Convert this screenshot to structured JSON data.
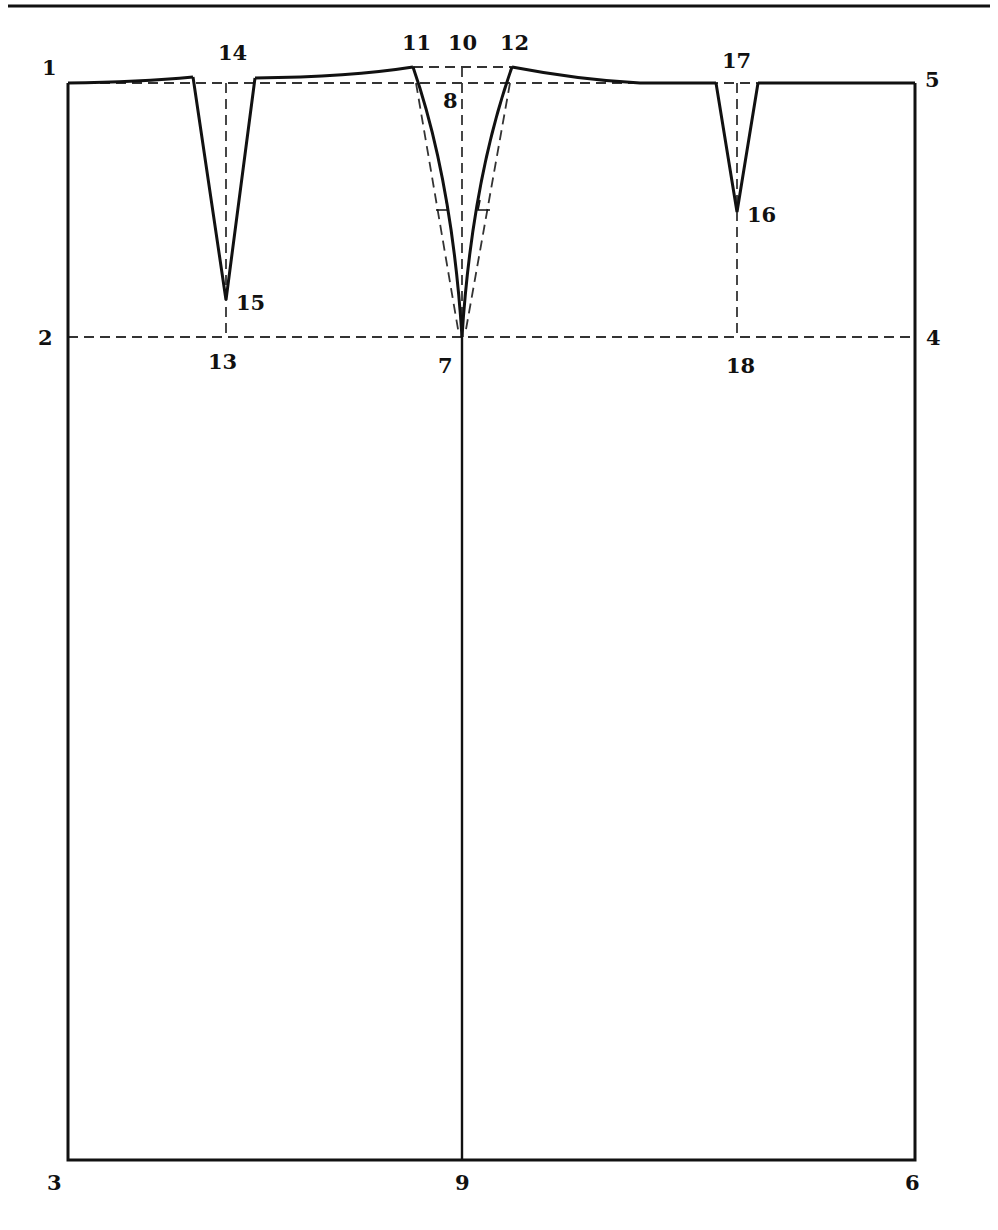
{
  "figure": {
    "type": "skirt-pattern-draft",
    "line_color": "#111111",
    "dash_color": "#333333",
    "background": "#ffffff"
  },
  "points": {
    "p1": "1",
    "p2": "2",
    "p3": "3",
    "p4": "4",
    "p5": "5",
    "p6": "6",
    "p7": "7",
    "p8": "8",
    "p9": "9",
    "p10": "10",
    "p11": "11",
    "p12": "12",
    "p13": "13",
    "p14": "14",
    "p15": "15",
    "p16": "16",
    "p17": "17",
    "p18": "18"
  }
}
